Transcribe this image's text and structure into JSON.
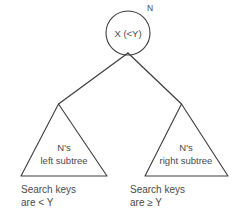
{
  "diagram": {
    "colors": {
      "background": "#ffffff",
      "stroke": "#3c3c3c",
      "text": "#4a4a4a"
    },
    "root_node": {
      "label": "X (<Y)",
      "tag": "N",
      "shape": "circle",
      "center_x": 128,
      "center_y": 33,
      "radius": 22
    },
    "left_subtree": {
      "shape": "triangle",
      "line1": "N's",
      "line2": "left subtree",
      "apex_x": 58,
      "apex_y": 104,
      "base_y": 176,
      "base_left_x": 21,
      "base_right_x": 107,
      "caption_line1": "Search keys",
      "caption_line2": "are < Y"
    },
    "right_subtree": {
      "shape": "triangle",
      "line1": "N's",
      "line2": "right subtree",
      "apex_x": 182,
      "apex_y": 104,
      "base_y": 176,
      "base_left_x": 145,
      "base_right_x": 228,
      "caption_line1": "Search keys",
      "caption_line2": "are ≥ Y"
    },
    "edges": [
      {
        "name": "root-to-left-subtree",
        "from_x": 128,
        "from_y": 54,
        "to_x": 58,
        "to_y": 104
      },
      {
        "name": "root-to-right-subtree",
        "from_x": 128,
        "from_y": 54,
        "to_x": 182,
        "to_y": 104
      }
    ]
  }
}
